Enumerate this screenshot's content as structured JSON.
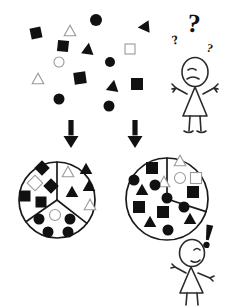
{
  "figure": {
    "background_color": "#ffffff",
    "ink_color": "#111111",
    "outline_color": "#9a9a9a",
    "figure_stroke_color": "#2a2a2a"
  },
  "scatter": {
    "label": "unsorted-shape-cloud",
    "count": 17,
    "shapes": [
      {
        "name": "square-filled",
        "kind": "square",
        "fill": "filled",
        "x": 36,
        "y": 33,
        "size": 11,
        "rot": -12
      },
      {
        "name": "triangle-outline",
        "kind": "triangle",
        "fill": "outline",
        "x": 70,
        "y": 31,
        "size": 11,
        "rot": 0
      },
      {
        "name": "circle-filled",
        "kind": "circle",
        "fill": "filled",
        "x": 96,
        "y": 20,
        "size": 12,
        "rot": 0
      },
      {
        "name": "triangle-filled",
        "kind": "triangle",
        "fill": "filled",
        "x": 144,
        "y": 27,
        "size": 12,
        "rot": -95
      },
      {
        "name": "square-filled",
        "kind": "square",
        "fill": "filled",
        "x": 63,
        "y": 46,
        "size": 11,
        "rot": 6
      },
      {
        "name": "triangle-filled",
        "kind": "triangle",
        "fill": "filled",
        "x": 88,
        "y": 49,
        "size": 12,
        "rot": 8
      },
      {
        "name": "square-outline",
        "kind": "square",
        "fill": "outline",
        "x": 130,
        "y": 49,
        "size": 10,
        "rot": 0
      },
      {
        "name": "circle-outline",
        "kind": "circle",
        "fill": "outline",
        "x": 59,
        "y": 62,
        "size": 10,
        "rot": 0
      },
      {
        "name": "circle-filled",
        "kind": "circle",
        "fill": "filled",
        "x": 110,
        "y": 62,
        "size": 10,
        "rot": 0
      },
      {
        "name": "triangle-outline",
        "kind": "triangle",
        "fill": "outline",
        "x": 38,
        "y": 79,
        "size": 11,
        "rot": 0
      },
      {
        "name": "square-filled",
        "kind": "square",
        "fill": "filled",
        "x": 80,
        "y": 78,
        "size": 12,
        "rot": -8
      },
      {
        "name": "triangle-filled",
        "kind": "triangle",
        "fill": "filled",
        "x": 113,
        "y": 86,
        "size": 12,
        "rot": 10
      },
      {
        "name": "square-filled",
        "kind": "square",
        "fill": "filled",
        "x": 137,
        "y": 84,
        "size": 12,
        "rot": 0
      },
      {
        "name": "circle-filled",
        "kind": "circle",
        "fill": "filled",
        "x": 59,
        "y": 99,
        "size": 11,
        "rot": 0
      },
      {
        "name": "circle-filled",
        "kind": "circle",
        "fill": "filled",
        "x": 109,
        "y": 106,
        "size": 11,
        "rot": 0
      }
    ]
  },
  "arrows": [
    {
      "name": "arrow-to-left-grouping",
      "x": 71,
      "y": 120,
      "length": 28
    },
    {
      "name": "arrow-to-right-grouping",
      "x": 135,
      "y": 120,
      "length": 28
    }
  ],
  "groupings": [
    {
      "name": "left-grouping-three-sectors",
      "center_x": 57,
      "center_y": 200,
      "radius": 38,
      "sector_count": 3,
      "sectors": [
        {
          "name": "sector-squares",
          "label": "squares and diamonds",
          "shapes": [
            {
              "kind": "diamond",
              "fill": "filled",
              "x": 42,
              "y": 168,
              "size": 11
            },
            {
              "kind": "diamond",
              "fill": "outline",
              "x": 35,
              "y": 183,
              "size": 11
            },
            {
              "kind": "diamond",
              "fill": "filled",
              "x": 51,
              "y": 186,
              "size": 11
            },
            {
              "kind": "square",
              "fill": "filled",
              "x": 25,
              "y": 196,
              "size": 11
            },
            {
              "kind": "square",
              "fill": "filled",
              "x": 41,
              "y": 202,
              "size": 11
            }
          ]
        },
        {
          "name": "sector-triangles",
          "label": "triangles",
          "shapes": [
            {
              "kind": "triangle",
              "fill": "outline",
              "x": 68,
              "y": 172,
              "size": 11
            },
            {
              "kind": "triangle",
              "fill": "filled",
              "x": 86,
              "y": 169,
              "size": 12
            },
            {
              "kind": "triangle",
              "fill": "filled",
              "x": 89,
              "y": 186,
              "size": 12
            },
            {
              "kind": "triangle",
              "fill": "filled",
              "x": 72,
              "y": 192,
              "size": 12
            },
            {
              "kind": "triangle",
              "fill": "outline",
              "x": 90,
              "y": 205,
              "size": 11
            }
          ]
        },
        {
          "name": "sector-circles",
          "label": "circles",
          "shapes": [
            {
              "kind": "circle",
              "fill": "filled",
              "x": 39,
              "y": 219,
              "size": 11
            },
            {
              "kind": "circle",
              "fill": "outline",
              "x": 55,
              "y": 215,
              "size": 11
            },
            {
              "kind": "circle",
              "fill": "filled",
              "x": 70,
              "y": 219,
              "size": 11
            },
            {
              "kind": "circle",
              "fill": "filled",
              "x": 48,
              "y": 232,
              "size": 11
            },
            {
              "kind": "circle",
              "fill": "filled",
              "x": 68,
              "y": 232,
              "size": 11
            }
          ]
        }
      ]
    },
    {
      "name": "right-grouping-two-sectors",
      "center_x": 167,
      "center_y": 199,
      "radius": 41,
      "sector_count": 2,
      "sectors": [
        {
          "name": "sector-outline-shapes",
          "label": "outline shapes",
          "shapes": [
            {
              "kind": "triangle",
              "fill": "outline",
              "x": 180,
              "y": 161,
              "size": 11
            },
            {
              "kind": "circle",
              "fill": "outline",
              "x": 180,
              "y": 178,
              "size": 11
            },
            {
              "kind": "square",
              "fill": "outline",
              "x": 196,
              "y": 178,
              "size": 11
            },
            {
              "kind": "triangle",
              "fill": "outline",
              "x": 164,
              "y": 182,
              "size": 11
            }
          ]
        },
        {
          "name": "sector-filled-shapes",
          "label": "filled shapes mixed",
          "shapes": [
            {
              "kind": "square",
              "fill": "filled",
              "x": 152,
              "y": 168,
              "size": 12
            },
            {
              "kind": "circle",
              "fill": "filled",
              "x": 134,
              "y": 180,
              "size": 11
            },
            {
              "kind": "circle",
              "fill": "filled",
              "x": 155,
              "y": 185,
              "size": 11
            },
            {
              "kind": "triangle",
              "fill": "filled",
              "x": 142,
              "y": 190,
              "size": 12
            },
            {
              "kind": "square",
              "fill": "filled",
              "x": 193,
              "y": 192,
              "size": 12
            },
            {
              "kind": "circle",
              "fill": "filled",
              "x": 167,
              "y": 198,
              "size": 11
            },
            {
              "kind": "square",
              "fill": "filled",
              "x": 139,
              "y": 207,
              "size": 12
            },
            {
              "kind": "square",
              "fill": "filled",
              "x": 163,
              "y": 212,
              "size": 12
            },
            {
              "kind": "circle",
              "fill": "filled",
              "x": 184,
              "y": 207,
              "size": 11
            },
            {
              "kind": "triangle",
              "fill": "filled",
              "x": 150,
              "y": 222,
              "size": 12
            },
            {
              "kind": "triangle",
              "fill": "filled",
              "x": 190,
              "y": 219,
              "size": 12
            },
            {
              "kind": "circle",
              "fill": "filled",
              "x": 168,
              "y": 230,
              "size": 11
            }
          ]
        }
      ]
    }
  ],
  "characters": [
    {
      "name": "confused-person",
      "expression": "confused",
      "x": 195,
      "y": 90,
      "symbols": [
        {
          "name": "question-mark-large",
          "glyph": "?",
          "x": 193,
          "y": 32,
          "size": 26,
          "rot": 6
        },
        {
          "name": "question-mark-small-left",
          "glyph": "?",
          "x": 176,
          "y": 44,
          "size": 13,
          "rot": -12
        },
        {
          "name": "question-mark-small-right",
          "glyph": "?",
          "x": 209,
          "y": 52,
          "size": 12,
          "rot": 14
        }
      ]
    },
    {
      "name": "satisfied-person",
      "expression": "pleased",
      "x": 192,
      "y": 275,
      "symbols": [
        {
          "name": "exclamation-mark",
          "glyph": "!",
          "x": 208,
          "y": 236,
          "size": 22,
          "rot": 10
        }
      ]
    }
  ]
}
